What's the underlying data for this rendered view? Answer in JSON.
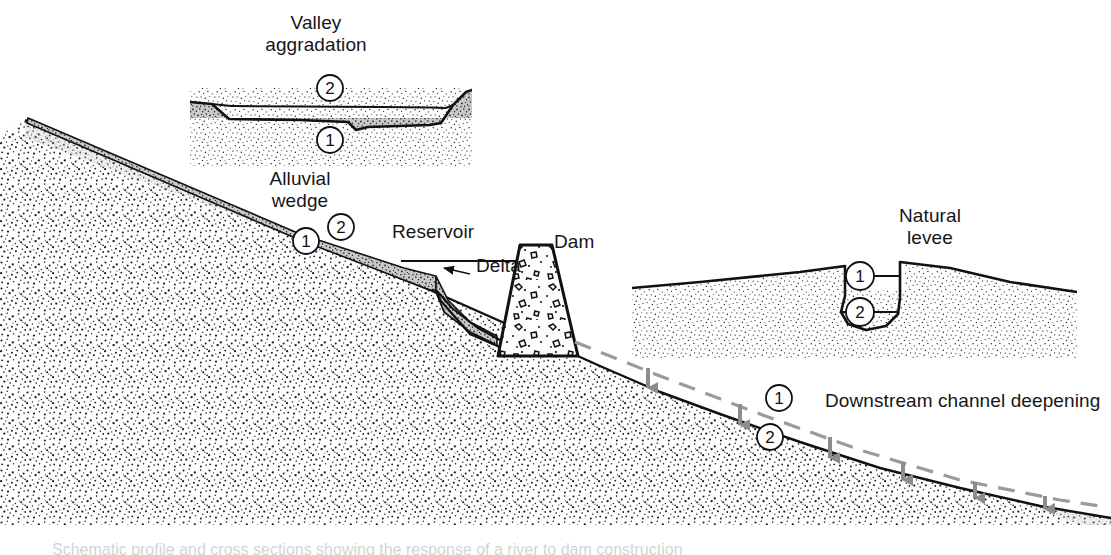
{
  "figure": {
    "title_caption": "Schematic profile and cross sections showing the response of a river to dam construction",
    "labels": {
      "valley_aggradation": "Valley\naggradation",
      "alluvial_wedge": "Alluvial\nwedge",
      "reservoir": "Reservoir",
      "delta": "Delta",
      "dam": "Dam",
      "natural_levee": "Natural\nlevee",
      "downstream_channel_deepening": "Downstream channel deepening"
    },
    "stage_markers": {
      "stage_one": "1",
      "stage_two": "2",
      "legend_meaning_one": "1",
      "legend_meaning_two": "2"
    },
    "markers": [
      {
        "id": "valley-aggradation-2",
        "value": "2",
        "x": 330,
        "y": 88
      },
      {
        "id": "valley-aggradation-1",
        "value": "1",
        "x": 330,
        "y": 140
      },
      {
        "id": "alluvial-wedge-2",
        "value": "2",
        "x": 341,
        "y": 227
      },
      {
        "id": "alluvial-wedge-1",
        "value": "1",
        "x": 306,
        "y": 241
      },
      {
        "id": "natural-levee-1",
        "value": "1",
        "x": 860,
        "y": 276
      },
      {
        "id": "natural-levee-2",
        "value": "2",
        "x": 860,
        "y": 312
      },
      {
        "id": "downstream-1",
        "value": "1",
        "x": 779,
        "y": 398
      },
      {
        "id": "downstream-2",
        "value": "2",
        "x": 770,
        "y": 437
      }
    ],
    "colors": {
      "ink": "#111111",
      "stipple_dark": "#2b2b2b",
      "stipple_light": "#6b6b6b",
      "wedge_fill": "#9a9a9a",
      "dashed_line": "#9b9b9b",
      "arrow_gray": "#8c8c8c",
      "paper": "#ffffff"
    },
    "arrow_count": 6,
    "dashed_line_meaning": "original pre-dam channel profile"
  }
}
